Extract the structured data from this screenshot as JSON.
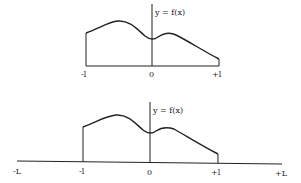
{
  "diagram": {
    "top_panel": {
      "function_label": "y = f(x)",
      "x_ticks": [
        "-l",
        "0",
        "+l"
      ],
      "description": "Function f(x) defined on interval [-l, +l]"
    },
    "bottom_panel": {
      "function_label": "y = f(x)",
      "x_ticks": [
        "-L",
        "-l",
        "0",
        "+l",
        "+L"
      ],
      "description": "Same f(x) on [-l, +l], zero extended to [-L, +L]"
    },
    "colors": {
      "ink": "#222222",
      "background": "#ffffff"
    }
  }
}
